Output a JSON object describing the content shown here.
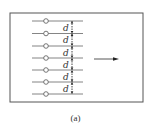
{
  "figure": {
    "caption": "(a)",
    "frame": {
      "x": 10,
      "y": 13,
      "width": 133,
      "height": 89,
      "stroke": "#555555"
    },
    "wires": {
      "count": 7,
      "x_start": 32,
      "x_end": 83,
      "y_positions": [
        21,
        33.5,
        46,
        58,
        70,
        82,
        94
      ],
      "terminal_x": 46,
      "terminal_radius": 2.3,
      "stroke": "#666666"
    },
    "spacing": {
      "label": "d",
      "count": 6,
      "dimension_line_x": 72,
      "label_x": 66
    },
    "arrow": {
      "x1": 94,
      "x2": 119,
      "y": 59,
      "color": "#222222"
    }
  }
}
